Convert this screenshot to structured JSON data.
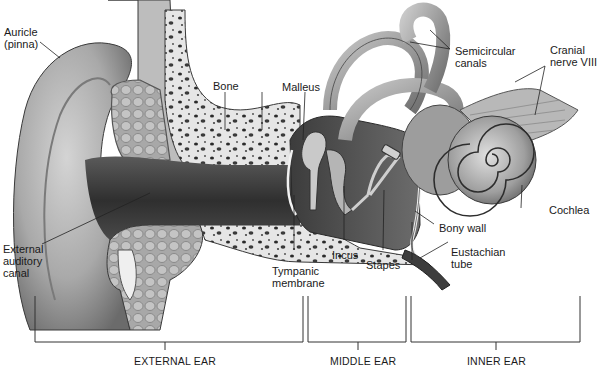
{
  "diagram": {
    "type": "anatomical-illustration",
    "labels": {
      "auricle": "Auricle\n(pinna)",
      "bone": "Bone",
      "malleus": "Malleus",
      "semicircular_canals": "Semicircular\ncanals",
      "cranial_nerve": "Cranial\nnerve VIII",
      "external_auditory_canal": "External\nauditory\ncanal",
      "cochlea": "Cochlea",
      "bony_wall": "Bony wall",
      "eustachian_tube": "Eustachian\ntube",
      "incus": "Incus",
      "stapes": "Stapes",
      "tympanic_membrane": "Tympanic\nmembrane"
    },
    "sections": [
      {
        "name": "EXTERNAL EAR",
        "x_start": 35,
        "x_end": 303
      },
      {
        "name": "MIDDLE EAR",
        "x_start": 308,
        "x_end": 406
      },
      {
        "name": "INNER EAR",
        "x_start": 411,
        "x_end": 580
      }
    ],
    "colors": {
      "background": "#ffffff",
      "line": "#333333",
      "tissue_light": "#d9d9d9",
      "tissue_mid": "#9a9a9a",
      "tissue_dark": "#4a4a4a",
      "canal_dark": "#3a3a3a",
      "bone_fill": "#e8e8e8"
    }
  }
}
